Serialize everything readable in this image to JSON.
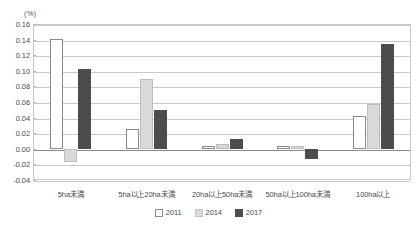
{
  "chart_data": {
    "type": "bar",
    "title": "",
    "subtitle": "",
    "unit_label": "(%)",
    "xlabel": "",
    "ylabel": "",
    "ylim": [
      -0.04,
      0.16
    ],
    "ytick_step": 0.02,
    "yticks": [
      "0.16",
      "0.14",
      "0.12",
      "0.10",
      "0.08",
      "0.06",
      "0.04",
      "0.02",
      "0.00",
      "-0.02",
      "-0.04"
    ],
    "ytick_values": [
      0.16,
      0.14,
      0.12,
      0.1,
      0.08,
      0.06,
      0.04,
      0.02,
      0.0,
      -0.02,
      -0.04
    ],
    "grid": true,
    "legend_position": "bottom",
    "categories": [
      "5ha未満",
      "5ha以上20ha未満",
      "20ha以上50ha未満",
      "50ha以上100ha未満",
      "100ha以上"
    ],
    "series": [
      {
        "name": "2011",
        "color": "#ffffff",
        "values": [
          0.141,
          0.026,
          0.004,
          0.004,
          0.042
        ]
      },
      {
        "name": "2014",
        "color": "#d9d9d9",
        "values": [
          -0.017,
          0.089,
          0.006,
          0.004,
          0.058
        ]
      },
      {
        "name": "2017",
        "color": "#4d4d4d",
        "values": [
          0.102,
          0.05,
          0.012,
          -0.013,
          0.134
        ]
      }
    ]
  },
  "legend": {
    "items": [
      {
        "label": "2011",
        "swatch": "s2011"
      },
      {
        "label": "2014",
        "swatch": "s2014"
      },
      {
        "label": "2017",
        "swatch": "s2017"
      }
    ]
  },
  "colors": {
    "series_2011": "#ffffff",
    "series_2014": "#d9d9d9",
    "series_2017": "#4d4d4d",
    "gridline": "#c9c9c9",
    "zero_line": "#8a8a8a",
    "frame": "#c9c9c9",
    "text": "#4a4a4a"
  }
}
